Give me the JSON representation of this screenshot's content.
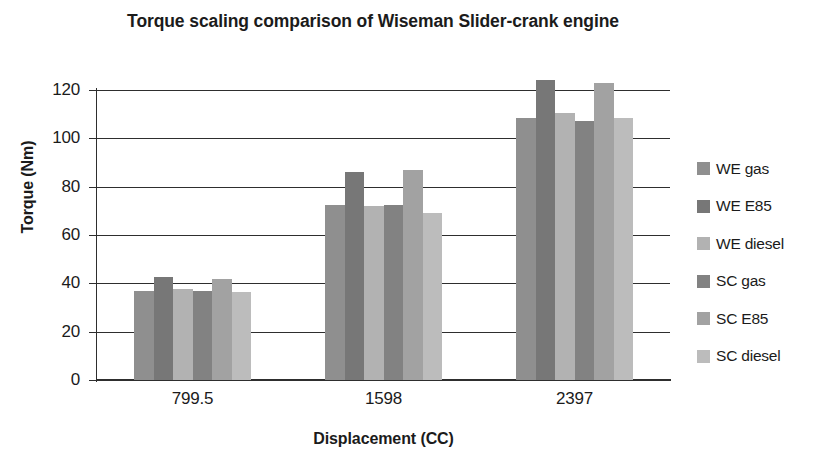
{
  "chart_data": {
    "type": "bar",
    "title": "Torque scaling comparison of Wiseman  Slider-crank engine",
    "title_line1": "Torque scaling comparison of Wiseman  Slider-crank",
    "title_line2": "engine",
    "xlabel": "Displacement (CC)",
    "ylabel": "Torque (Nm)",
    "categories": [
      "799.5",
      "1598",
      "2397"
    ],
    "ylim": [
      0,
      120
    ],
    "yticks": [
      0,
      20,
      40,
      60,
      80,
      100,
      120
    ],
    "ytick_labels": [
      "0",
      "20",
      "40",
      "60",
      "80",
      "100",
      "120"
    ],
    "grid": true,
    "legend_position": "right",
    "series": [
      {
        "name": "WE gas",
        "color": "#8f8f8f",
        "values": [
          37.0,
          72.5,
          108.5
        ]
      },
      {
        "name": "WE E85",
        "color": "#777777",
        "values": [
          42.5,
          86.0,
          124.0
        ]
      },
      {
        "name": "WE diesel",
        "color": "#b2b2b2",
        "values": [
          37.5,
          72.0,
          110.5
        ]
      },
      {
        "name": "SC gas",
        "color": "#828282",
        "values": [
          37.0,
          72.5,
          107.0
        ]
      },
      {
        "name": "SC E85",
        "color": "#a2a2a2",
        "values": [
          42.0,
          87.0,
          123.0
        ]
      },
      {
        "name": "SC diesel",
        "color": "#bcbcbc",
        "values": [
          36.5,
          69.0,
          108.5
        ]
      }
    ]
  },
  "colors": {
    "axis": "#2e2e2e",
    "text": "#1b1b1b",
    "background": "#ffffff"
  }
}
